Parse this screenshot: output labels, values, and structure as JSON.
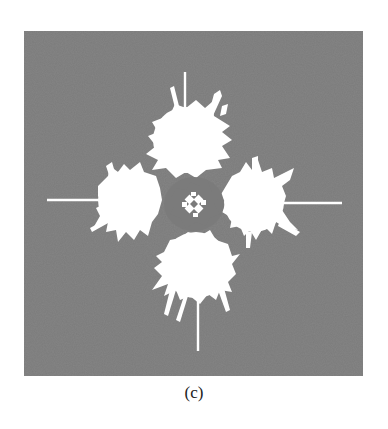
{
  "figure": {
    "panel_label": "(c)",
    "colors": {
      "background": "#ffffff",
      "panel": "#7b7b7b",
      "pattern": "#ffffff",
      "caption": "#222222"
    },
    "panel_bounds": {
      "x": 24,
      "y": 31,
      "width": 339,
      "height": 345
    },
    "lobes": [
      {
        "name": "top",
        "cx": 186,
        "cy": 138,
        "r": 38
      },
      {
        "name": "left",
        "cx": 127,
        "cy": 200,
        "r": 36
      },
      {
        "name": "right",
        "cx": 255,
        "cy": 202,
        "r": 36
      },
      {
        "name": "bottom",
        "cx": 196,
        "cy": 265,
        "r": 38
      }
    ],
    "streaks": [
      {
        "name": "top-vertical",
        "x1": 185,
        "y1": 72,
        "x2": 185,
        "y2": 120
      },
      {
        "name": "left-horizontal",
        "x1": 47,
        "y1": 200,
        "x2": 100,
        "y2": 200
      },
      {
        "name": "right-horizontal",
        "x1": 280,
        "y1": 203,
        "x2": 342,
        "y2": 203
      },
      {
        "name": "bottom-vertical",
        "x1": 198,
        "y1": 290,
        "x2": 198,
        "y2": 351
      }
    ]
  }
}
